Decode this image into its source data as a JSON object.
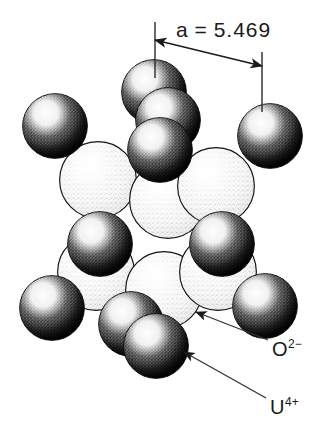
{
  "figure": {
    "kind": "crystal-structure-packing-diagram",
    "background": "#ffffff"
  },
  "dimension": {
    "name": "lattice-parameter",
    "symbol": "a",
    "equals": "=",
    "value": "5.469",
    "text": "a = 5.469",
    "line_from_x": 155,
    "line_from_y": 40,
    "line_to_x": 262,
    "line_to_y": 66,
    "ext_left_x": 155,
    "ext_left_top": 22,
    "ext_left_bottom": 78,
    "ext_right_x": 262,
    "ext_right_top": 52,
    "ext_right_bottom": 112
  },
  "labels": {
    "anion": {
      "element": "O",
      "charge": "2−",
      "text": "O2−"
    },
    "cation": {
      "element": "U",
      "charge": "4+",
      "text": "U4+"
    }
  },
  "leaders": [
    {
      "name": "leader-oxygen",
      "from_x": 268,
      "from_y": 340,
      "to_x": 196,
      "to_y": 312
    },
    {
      "name": "leader-uranium",
      "from_x": 266,
      "from_y": 398,
      "to_x": 184,
      "to_y": 352
    }
  ],
  "colors": {
    "anion_fill": "#fdfdfd",
    "anion_stipple": "#5a5a5a",
    "cation_fill": "#111111",
    "cation_highlight": "#ffffff",
    "outline": "#111111",
    "leader_line": "#333333"
  },
  "atoms": {
    "anion_radius": 39,
    "cation_radius": 33,
    "anions": [
      {
        "cx": 98,
        "cy": 180
      },
      {
        "cx": 168,
        "cy": 200
      },
      {
        "cx": 216,
        "cy": 186
      },
      {
        "cx": 96,
        "cy": 272
      },
      {
        "cx": 164,
        "cy": 290
      },
      {
        "cx": 218,
        "cy": 272
      }
    ],
    "cations": [
      {
        "cx": 55,
        "cy": 126
      },
      {
        "cx": 154,
        "cy": 92
      },
      {
        "cx": 168,
        "cy": 120
      },
      {
        "cx": 160,
        "cy": 150
      },
      {
        "cx": 270,
        "cy": 136
      },
      {
        "cx": 100,
        "cy": 244
      },
      {
        "cx": 222,
        "cy": 244
      },
      {
        "cx": 52,
        "cy": 308
      },
      {
        "cx": 131,
        "cy": 324
      },
      {
        "cx": 156,
        "cy": 346
      },
      {
        "cx": 265,
        "cy": 306
      }
    ]
  }
}
